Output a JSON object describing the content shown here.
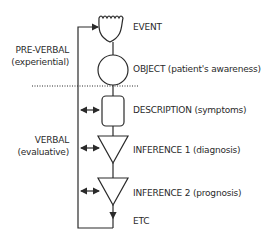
{
  "diagram": {
    "nodes": [
      {
        "id": "event",
        "shape": "cup-wavy",
        "label": "EVENT"
      },
      {
        "id": "object",
        "shape": "circle",
        "label": "OBJECT (patient's awareness)"
      },
      {
        "id": "description",
        "shape": "rounded-rect",
        "label": "DESCRIPTION (symptoms)"
      },
      {
        "id": "inference1",
        "shape": "triangle-down",
        "label": "INFERENCE 1 (diagnosis)"
      },
      {
        "id": "inference2",
        "shape": "triangle-down",
        "label": "INFERENCE 2 (prognosis)"
      },
      {
        "id": "etc",
        "shape": "arrow-end",
        "label": "ETC"
      }
    ],
    "regions": {
      "pre_verbal": {
        "title": "PRE-VERBAL",
        "subtitle": "(experiential)"
      },
      "verbal": {
        "title": "VERBAL",
        "subtitle": "(evaluative)"
      }
    },
    "separator": "dotted",
    "feedback_loop": "from ETC back to EVENT, with bidirectional arrows to DESCRIPTION, INFERENCE 1, INFERENCE 2",
    "colors": {
      "stroke": "#2a2a2a",
      "background": "#ffffff"
    }
  }
}
